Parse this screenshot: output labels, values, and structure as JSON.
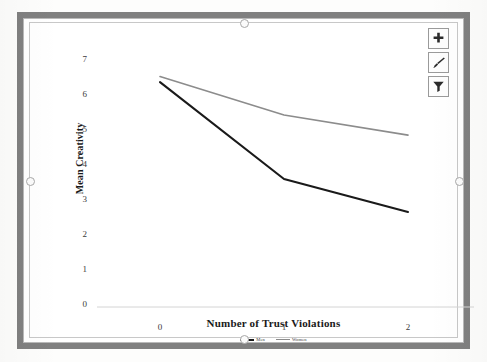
{
  "chart_data": {
    "type": "line",
    "title": "",
    "xlabel": "Number of Trust Violations",
    "ylabel": "Mean Creativity",
    "categories": [
      "0",
      "1",
      "2"
    ],
    "x": [
      0,
      1,
      2
    ],
    "xlim": [
      0,
      2
    ],
    "ylim": [
      0,
      7
    ],
    "yticks": [
      "0",
      "1",
      "2",
      "3",
      "4",
      "5",
      "6",
      "7"
    ],
    "xticks": [
      "0",
      "1",
      "2"
    ],
    "grid": false,
    "legend_position": "bottom",
    "series": [
      {
        "name": "Men",
        "values": [
          6.15,
          3.5,
          2.6
        ],
        "color": "#1a1a1a"
      },
      {
        "name": "Women",
        "values": [
          6.3,
          5.25,
          4.7
        ],
        "color": "#8c8c8c"
      }
    ]
  },
  "chart_tools": {
    "elements_button": "chart-elements",
    "styles_button": "chart-styles",
    "filters_button": "chart-filters"
  },
  "colors": {
    "series_men": "#1a1a1a",
    "series_women": "#8c8c8c",
    "axis": "#d4d4d4",
    "frame": "#808080",
    "text": "#1a1a1a"
  }
}
